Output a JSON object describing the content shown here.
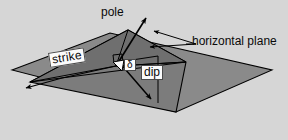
{
  "figure": {
    "type": "geometric-diagram",
    "background_color": "#d6d6d6",
    "plane_fill_color": "#8a8a8a",
    "dipping_plane_fill_color": "#6f6f6f",
    "outline_color": "#000000",
    "label_box_fill": "#fbfbfb",
    "label_box_border": "#4a4a4a"
  },
  "labels": {
    "pole": "pole",
    "horizontal_plane": "horizontal plane",
    "strike": "strike",
    "dip": "dip",
    "dip_angle_symbol": "δ"
  },
  "elements": {
    "horizontal_plane_name": "horizontal-plane-surface",
    "dipping_plane_name": "dipping-plane-surface",
    "strike_line_name": "strike-line",
    "dip_vector_name": "dip-direction-arrow",
    "pole_vector_name": "pole-normal-arrow",
    "right_angle_marker_name": "right-angle-marker",
    "dip_angle_wedge_name": "dip-angle-wedge"
  },
  "annotations": {
    "pole_leader": "arrow from plane intersection pointing up-right to pole label",
    "horizontal_plane_leaders": "two arrows pointing up-left toward the horizontal plane edges",
    "strike_arrow": "arrow pointing down-left along the strike direction",
    "dip_arrow": "arrow pointing down-right along the steepest descent"
  }
}
